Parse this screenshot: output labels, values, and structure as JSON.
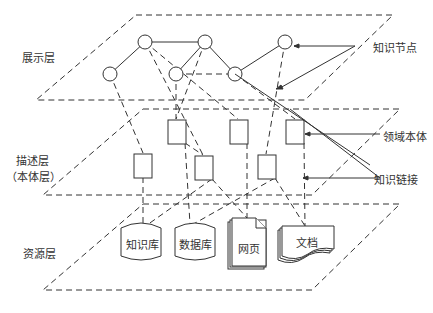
{
  "layers": {
    "presentation": "展示层",
    "description_line1": "描述层",
    "description_line2": "（本体层）",
    "resource": "资源层"
  },
  "callouts": {
    "knowledge_node": "知识节点",
    "domain_ontology": "领域本体",
    "knowledge_link": "知识链接"
  },
  "resources": {
    "knowledge_base": "知识库",
    "database": "数据库",
    "webpage": "网页",
    "document": "文档"
  },
  "colors": {
    "stroke": "#333333",
    "background": "#ffffff"
  }
}
